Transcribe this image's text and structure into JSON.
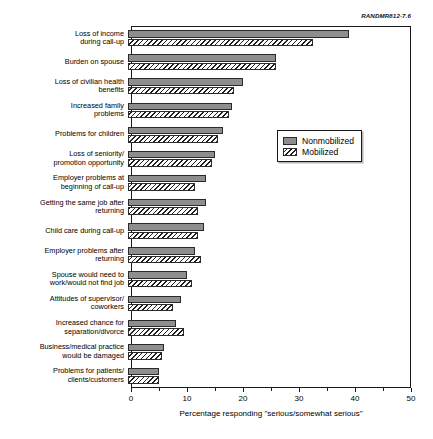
{
  "figure": {
    "source_id": "RANDMR812-7.6"
  },
  "legend": {
    "items": [
      {
        "label": "Nonmobilized",
        "pattern": "solid",
        "color": "#8e8e8e"
      },
      {
        "label": "Mobilized",
        "pattern": "hatch",
        "color": "#ffffff"
      }
    ]
  },
  "axis": {
    "ticks": [
      0,
      10,
      20,
      30,
      40,
      50
    ],
    "minor_ticks": [
      5,
      15,
      25,
      35,
      45
    ]
  },
  "chart_data": {
    "type": "bar",
    "orientation": "horizontal",
    "title": "",
    "xlabel": "Percentage responding \"serious/somewhat serious\"",
    "ylabel": "",
    "xlim": [
      0,
      50
    ],
    "xticks": [
      0,
      10,
      20,
      30,
      40,
      50
    ],
    "grid": false,
    "legend_position": "middle-right",
    "categories": [
      "Loss of income\nduring call-up",
      "Burden on spouse",
      "Loss of civilian health\nbenefits",
      "Increased family\nproblems",
      "Problems for children",
      "Loss of seniority/\npromotion opportunity",
      "Employer problems at\nbeginning of call-up",
      "Getting the same job after\nreturning",
      "Child care during call-up",
      "Employer problems after\nreturning",
      "Spouse would need to\nwork/would not find job",
      "Attitudes of supervisor/\ncoworkers",
      "Increased chance for\nseparation/divorce",
      "Business/medical practice\nwould be damaged",
      "Problems for patients/\nclients/customers"
    ],
    "series": [
      {
        "name": "Nonmobilized",
        "values": [
          39.5,
          26.5,
          20.5,
          18.5,
          17.0,
          15.5,
          14.0,
          14.0,
          13.5,
          12.0,
          10.5,
          9.5,
          8.5,
          6.5,
          5.5
        ]
      },
      {
        "name": "Mobilized",
        "values": [
          33.0,
          26.5,
          19.0,
          18.0,
          16.0,
          15.0,
          12.0,
          12.5,
          12.5,
          13.0,
          11.5,
          8.0,
          10.0,
          6.0,
          5.5
        ]
      }
    ]
  }
}
